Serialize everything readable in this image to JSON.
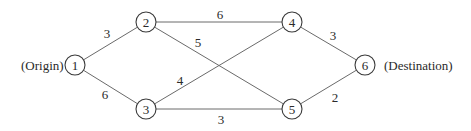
{
  "diagram": {
    "type": "network",
    "labels": {
      "origin": "(Origin)",
      "destination": "(Destination)"
    },
    "nodes": [
      {
        "id": "1",
        "label": "1",
        "x": 75,
        "y": 65
      },
      {
        "id": "2",
        "label": "2",
        "x": 146,
        "y": 22
      },
      {
        "id": "3",
        "label": "3",
        "x": 146,
        "y": 109
      },
      {
        "id": "4",
        "label": "4",
        "x": 292,
        "y": 22
      },
      {
        "id": "5",
        "label": "5",
        "x": 292,
        "y": 109
      },
      {
        "id": "6",
        "label": "6",
        "x": 365,
        "y": 65
      }
    ],
    "edges": [
      {
        "from": "1",
        "to": "2",
        "weight": "3"
      },
      {
        "from": "1",
        "to": "3",
        "weight": "6"
      },
      {
        "from": "2",
        "to": "4",
        "weight": "6"
      },
      {
        "from": "2",
        "to": "5",
        "weight": "5"
      },
      {
        "from": "3",
        "to": "4",
        "weight": "4"
      },
      {
        "from": "3",
        "to": "5",
        "weight": "3"
      },
      {
        "from": "4",
        "to": "6",
        "weight": "3"
      },
      {
        "from": "5",
        "to": "6",
        "weight": "2"
      }
    ]
  }
}
